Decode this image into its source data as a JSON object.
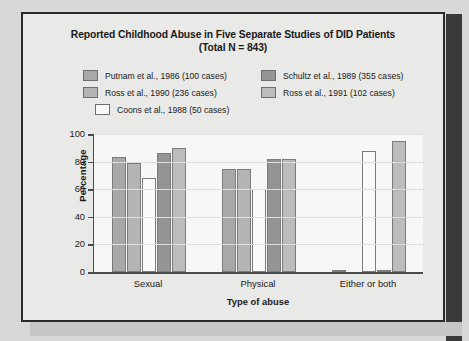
{
  "chart_data": {
    "type": "bar",
    "title": "Reported Childhood Abuse in Five Separate Studies of DID Patients",
    "subtitle": "(Total N = 843)",
    "xlabel": "Type of abuse",
    "ylabel": "Percentage",
    "categories": [
      "Sexual",
      "Physical",
      "Either or both"
    ],
    "ylim": [
      0,
      100
    ],
    "yticks": [
      0,
      20,
      40,
      60,
      80,
      100
    ],
    "grid": true,
    "legend_position": "top",
    "series": [
      {
        "name": "Putnam et al., 1986 (100 cases)",
        "color": "#a8a8a8",
        "values": [
          83,
          75,
          1
        ]
      },
      {
        "name": "Ross et al., 1990 (236 cases)",
        "color": "#b4b4b4",
        "values": [
          79,
          75,
          0
        ]
      },
      {
        "name": "Coons et al., 1988 (50 cases)",
        "color": "#fafafa",
        "values": [
          68,
          60,
          88
        ]
      },
      {
        "name": "Schultz et al., 1989 (355 cases)",
        "color": "#949494",
        "values": [
          86,
          82,
          1
        ]
      },
      {
        "name": "Ross et al., 1991 (102 cases)",
        "color": "#bcbcbc",
        "values": [
          90,
          82,
          95
        ]
      }
    ]
  },
  "figure": {
    "frame_border_color": "#2b2b2b",
    "shadow_color": "#3a3a3a",
    "page_background": "#d8d8d6",
    "plot_background": "#f7f7f5"
  }
}
